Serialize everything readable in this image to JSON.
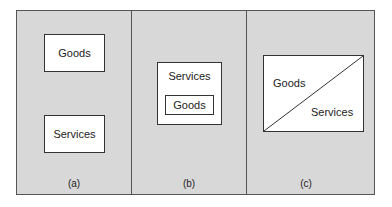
{
  "panels": [
    {
      "id": "a",
      "caption": "(a)",
      "boxes": [
        {
          "label": "Goods"
        },
        {
          "label": "Services"
        }
      ]
    },
    {
      "id": "b",
      "caption": "(b)",
      "outer_label": "Services",
      "inner_label": "Goods"
    },
    {
      "id": "c",
      "caption": "(c)",
      "upper_left_label": "Goods",
      "lower_right_label": "Services"
    }
  ],
  "colors": {
    "background": "#d8d8d8",
    "box_fill": "#ffffff",
    "line": "#333333"
  }
}
